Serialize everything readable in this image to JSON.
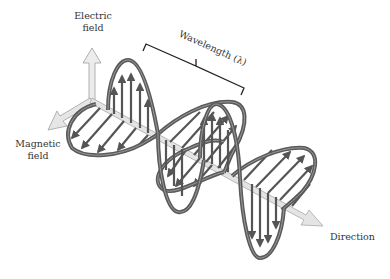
{
  "diagram": {
    "type": "electromagnetic-wave",
    "labels": {
      "electric_field_line1": "Electric",
      "electric_field_line2": "field",
      "magnetic_field_line1": "Magnetic",
      "magnetic_field_line2": "field",
      "wavelength": "Wavelength (λ)",
      "direction": "Direction"
    },
    "colors": {
      "background": "#ffffff",
      "wave_tube": "#5a5a5a",
      "wave_tube_highlight": "#9a9a9a",
      "field_vectors": "#555555",
      "axis_arrows": "#d9d9d9",
      "axis_outline": "#9c9c9c",
      "bracket": "#222222",
      "text": "#333333"
    },
    "components": [
      "electric-field-axis",
      "magnetic-field-axis",
      "direction-axis",
      "electric-field-wave",
      "magnetic-field-wave",
      "wavelength-bracket"
    ]
  }
}
